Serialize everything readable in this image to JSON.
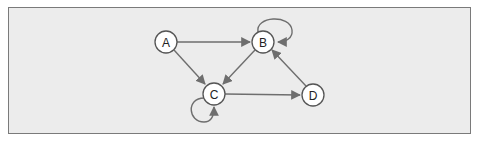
{
  "diagram": {
    "type": "directed-graph",
    "colors": {
      "background": "#ececec",
      "frame_border": "#7a7a7a",
      "edge": "#6e6e6e",
      "node_fill": "#ffffff",
      "node_stroke": "#555555"
    },
    "nodes": [
      {
        "id": "A",
        "label": "A",
        "x": 166,
        "y": 42
      },
      {
        "id": "B",
        "label": "B",
        "x": 263,
        "y": 42
      },
      {
        "id": "C",
        "label": "C",
        "x": 214,
        "y": 94
      },
      {
        "id": "D",
        "label": "D",
        "x": 313,
        "y": 95
      }
    ],
    "edges": [
      {
        "from": "A",
        "to": "B"
      },
      {
        "from": "A",
        "to": "C"
      },
      {
        "from": "B",
        "to": "C"
      },
      {
        "from": "C",
        "to": "D"
      },
      {
        "from": "D",
        "to": "B"
      },
      {
        "from": "B",
        "to": "B",
        "self_loop": true
      },
      {
        "from": "C",
        "to": "C",
        "self_loop": true
      }
    ]
  }
}
